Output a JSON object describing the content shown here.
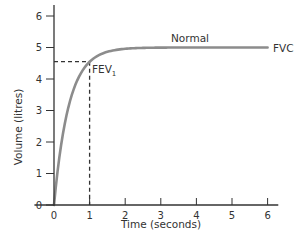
{
  "chart_data": {
    "type": "line",
    "title": "",
    "xlabel": "Time (seconds)",
    "ylabel": "Volume (litres)",
    "xlim": [
      0,
      6
    ],
    "ylim": [
      0,
      6
    ],
    "x_ticks": [
      0,
      1,
      2,
      3,
      4,
      5,
      6
    ],
    "y_ticks": [
      0,
      1,
      2,
      3,
      4,
      5,
      6
    ],
    "grid": false,
    "legend": null,
    "series": [
      {
        "name": "Normal",
        "color": "#8c8c8c",
        "x": [
          0,
          0.1,
          0.2,
          0.3,
          0.4,
          0.5,
          0.6,
          0.8,
          1.0,
          1.25,
          1.5,
          2.0,
          2.5,
          3.0,
          4.0,
          5.0,
          6.0
        ],
        "y": [
          0,
          1.07,
          1.91,
          2.57,
          3.09,
          3.49,
          3.81,
          4.27,
          4.55,
          4.75,
          4.86,
          4.96,
          4.99,
          5.0,
          5.0,
          5.0,
          5.0
        ]
      }
    ],
    "annotations": [
      {
        "text": "Normal",
        "x": 3.5,
        "y": 5.15,
        "role": "curve-label"
      },
      {
        "text": "FVC",
        "x": 6.05,
        "y": 5.0,
        "role": "end-label"
      },
      {
        "text": "FEV",
        "subscript": "1",
        "x": 1.0,
        "y": 4.55,
        "role": "point-label"
      }
    ],
    "reference_lines": [
      {
        "type": "horizontal-dashed",
        "y": 4.55,
        "from_x": 0,
        "to_x": 1.0,
        "label": "FEV1 level"
      },
      {
        "type": "vertical-dashed",
        "x": 1.0,
        "from_y": 0,
        "to_y": 4.55,
        "label": "1 second"
      }
    ]
  },
  "labels": {
    "xlabel": "Time (seconds)",
    "ylabel": "Volume (litres)",
    "normal": "Normal",
    "fvc": "FVC",
    "fev": "FEV",
    "fev_sub": "1"
  },
  "ticks": {
    "x": [
      "0",
      "1",
      "2",
      "3",
      "4",
      "5",
      "6"
    ],
    "y": [
      "0",
      "1",
      "2",
      "3",
      "4",
      "5",
      "6"
    ]
  }
}
